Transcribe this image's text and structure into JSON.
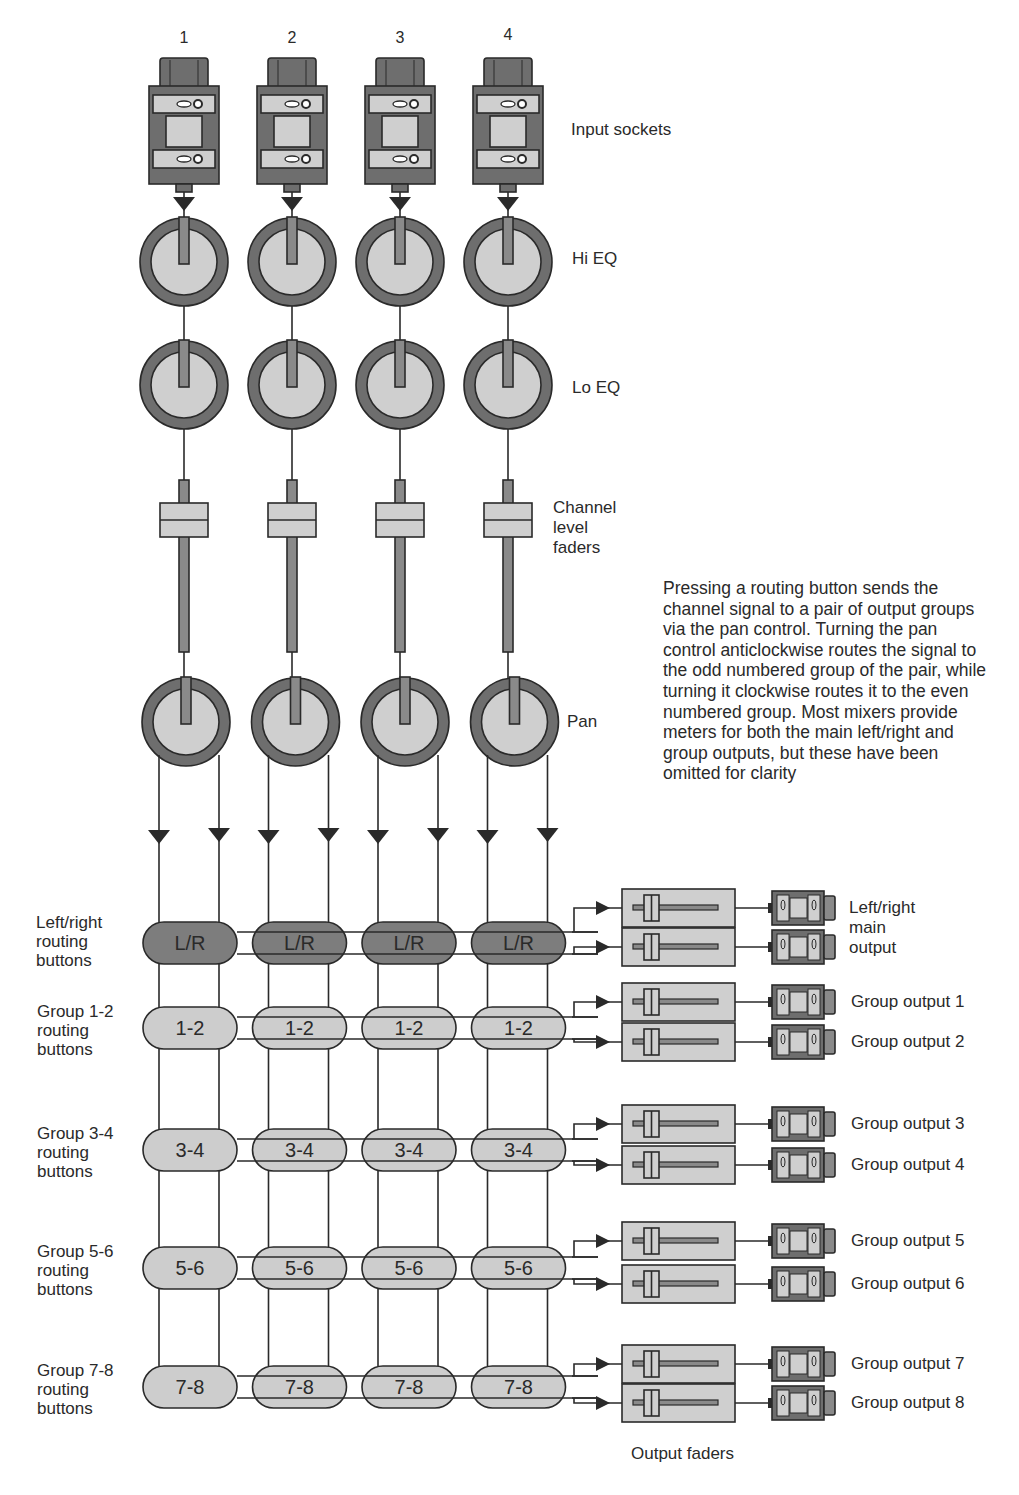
{
  "colors": {
    "dark_gray": "#6e6e6e",
    "mid_gray": "#8a8a8a",
    "light_gray": "#cfcfcf",
    "lr_button": "#7d7d7d",
    "group_button": "#cdcdcd",
    "line": "#2a2a2a",
    "background": "#ffffff"
  },
  "channels": [
    {
      "number": "1",
      "x": 184
    },
    {
      "number": "2",
      "x": 292
    },
    {
      "number": "3",
      "x": 400
    },
    {
      "number": "4",
      "x": 508
    }
  ],
  "row_labels": {
    "input_sockets": "Input sockets",
    "hi_eq": "Hi EQ",
    "lo_eq": "Lo EQ",
    "channel_faders": "Channel\nlevel\nfaders",
    "pan": "Pan"
  },
  "explanation": "Pressing a routing button sends the channel signal to a pair of output groups via the pan control. Turning the pan control anticlockwise routes the signal to the odd numbered group of the pair, while turning it clockwise routes it to the even numbered group. Most mixers provide meters for both the main left/right and group outputs, but these have been omitted for clarity",
  "routing_rows": [
    {
      "button_label": "L/R",
      "row_label": "Left/right\nrouting\nbuttons",
      "y": 943,
      "style": "dark"
    },
    {
      "button_label": "1-2",
      "row_label": "Group 1-2\nrouting\nbuttons",
      "y": 1028,
      "style": "light"
    },
    {
      "button_label": "3-4",
      "row_label": "Group 3-4\nrouting\nbuttons",
      "y": 1150,
      "style": "light"
    },
    {
      "button_label": "5-6",
      "row_label": "Group 5-6\nrouting\nbuttons",
      "y": 1268,
      "style": "light"
    },
    {
      "button_label": "7-8",
      "row_label": "Group 7-8\nrouting\nbuttons",
      "y": 1387,
      "style": "light"
    }
  ],
  "outputs": [
    {
      "label": "Left/right\nmain\noutput",
      "y_top": 908,
      "y_bottom": 947,
      "shared_label": true
    },
    {
      "label": "Group output 1",
      "y_top": 1002
    },
    {
      "label": "Group output 2",
      "y_top": 1042
    },
    {
      "label": "Group output 3",
      "y_top": 1124
    },
    {
      "label": "Group output 4",
      "y_top": 1165
    },
    {
      "label": "Group output 5",
      "y_top": 1241
    },
    {
      "label": "Group output 6",
      "y_top": 1284
    },
    {
      "label": "Group output 7",
      "y_top": 1364
    },
    {
      "label": "Group output 8",
      "y_top": 1403
    }
  ],
  "output_faders_label": "Output faders"
}
